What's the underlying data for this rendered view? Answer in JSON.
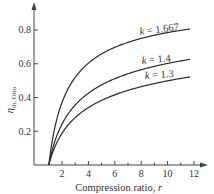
{
  "chart_data": {
    "type": "line",
    "title": "",
    "xlabel": "Compression ratio, r",
    "ylabel": "η_th,Otto",
    "xlim": [
      0,
      13
    ],
    "ylim": [
      0,
      0.95
    ],
    "grid": false,
    "legend": "inline labels at curve ends",
    "x_ticks": [
      2,
      4,
      6,
      8,
      10,
      12
    ],
    "x_tick_labels": [
      "2",
      "4",
      "6",
      "8",
      "10",
      "12"
    ],
    "x_minor_ticks": [
      3,
      5,
      7,
      9,
      11
    ],
    "y_ticks": [
      0.2,
      0.4,
      0.6,
      0.8
    ],
    "y_tick_labels": [
      "0.2",
      "0.4",
      "0.6",
      "0.8"
    ],
    "formula": "η = 1 − r^(1−k)",
    "x": [
      1,
      1.5,
      2,
      3,
      4,
      5,
      6,
      7,
      8,
      9,
      10,
      11,
      11.7
    ],
    "series": [
      {
        "name": "k = 1.667",
        "k": 1.667,
        "values": [
          0,
          0.237,
          0.371,
          0.519,
          0.603,
          0.658,
          0.697,
          0.727,
          0.75,
          0.769,
          0.785,
          0.798,
          0.806
        ]
      },
      {
        "name": "k = 1.4",
        "k": 1.4,
        "values": [
          0,
          0.15,
          0.242,
          0.356,
          0.426,
          0.475,
          0.512,
          0.541,
          0.565,
          0.585,
          0.602,
          0.617,
          0.626
        ]
      },
      {
        "name": "k = 1.3",
        "k": 1.3,
        "values": [
          0,
          0.115,
          0.188,
          0.281,
          0.34,
          0.383,
          0.416,
          0.442,
          0.464,
          0.483,
          0.499,
          0.513,
          0.522
        ]
      }
    ]
  },
  "labels": {
    "y_axis_symbol": "η",
    "y_axis_subscript": "th, Otto",
    "x_axis_title": "Compression ratio, ",
    "x_axis_var": "r",
    "curve_1": "k = 1.667",
    "curve_2": "k = 1.4",
    "curve_3": "k = 1.3",
    "curve_1_k": "k",
    "curve_1_val": " = 1.667",
    "curve_2_k": "k",
    "curve_2_val": " = 1.4",
    "curve_3_k": "k",
    "curve_3_val": " = 1.3",
    "tick_x_2": "2",
    "tick_x_4": "4",
    "tick_x_6": "6",
    "tick_x_8": "8",
    "tick_x_10": "10",
    "tick_x_12": "12",
    "tick_y_02": "0.2",
    "tick_y_04": "0.4",
    "tick_y_06": "0.6",
    "tick_y_08": "0.8"
  },
  "colors": {
    "line": "#2a2a2a",
    "axis": "#444444",
    "text": "#333333",
    "background": "#ffffff"
  }
}
